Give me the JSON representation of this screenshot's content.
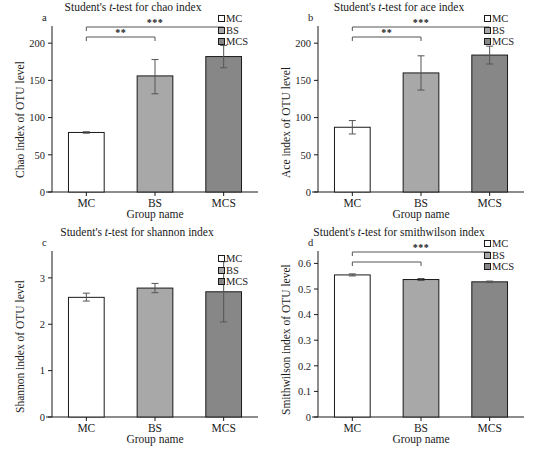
{
  "figure": {
    "panels": [
      {
        "letter": "a",
        "title_pre": "Student's ",
        "title_ital": "t",
        "title_post": "-test for chao index",
        "ylabel": "Chao index of OTU level",
        "xlabel": "Group name"
      },
      {
        "letter": "b",
        "title_pre": "Student's ",
        "title_ital": "t",
        "title_post": "-test for ace index",
        "ylabel": "Ace index of OTU level",
        "xlabel": "Group name"
      },
      {
        "letter": "c",
        "title_pre": "Student's ",
        "title_ital": "t",
        "title_post": "-test for shannon index",
        "ylabel": "Shannon index of OTU level",
        "xlabel": "Group name"
      },
      {
        "letter": "d",
        "title_pre": "Student's ",
        "title_ital": "t",
        "title_post": "-test for smithwilson index",
        "ylabel": "Smithwilson index of OTU level",
        "xlabel": "Group name"
      }
    ],
    "legend": [
      {
        "label": "MC",
        "color": "#ffffff"
      },
      {
        "label": "BS",
        "color": "#a8a8a8"
      },
      {
        "label": "MCS",
        "color": "#878787"
      }
    ]
  },
  "chart_data": [
    {
      "type": "bar",
      "panel": "a",
      "title": "Student's t-test for chao index",
      "xlabel": "Group name",
      "ylabel": "Chao index of OTU level",
      "categories": [
        "MC",
        "BS",
        "MCS"
      ],
      "values": [
        80,
        156,
        182
      ],
      "errors_low": [
        79,
        132,
        167
      ],
      "errors_high": [
        81,
        178,
        197
      ],
      "colors": [
        "#ffffff",
        "#a8a8a8",
        "#878787"
      ],
      "ylim": [
        0,
        215
      ],
      "yticks": [
        0,
        50,
        100,
        150,
        200
      ],
      "ytick_labels": [
        "0",
        "50",
        "100",
        "150",
        "200"
      ],
      "grid": false,
      "legend_position": "top-right",
      "annotations": [
        {
          "label": "***",
          "from": "MC",
          "to": "MCS"
        },
        {
          "label": "**",
          "from": "MC",
          "to": "BS"
        }
      ]
    },
    {
      "type": "bar",
      "panel": "b",
      "title": "Student's t-test for ace index",
      "xlabel": "Group name",
      "ylabel": "Ace index of OTU level",
      "categories": [
        "MC",
        "BS",
        "MCS"
      ],
      "values": [
        87,
        160,
        184
      ],
      "errors_low": [
        78,
        137,
        172
      ],
      "errors_high": [
        96,
        183,
        196
      ],
      "colors": [
        "#ffffff",
        "#a8a8a8",
        "#878787"
      ],
      "ylim": [
        0,
        215
      ],
      "yticks": [
        0,
        50,
        100,
        150,
        200
      ],
      "ytick_labels": [
        "0",
        "50",
        "100",
        "150",
        "200"
      ],
      "grid": false,
      "legend_position": "top-right",
      "annotations": [
        {
          "label": "***",
          "from": "MC",
          "to": "MCS"
        },
        {
          "label": "**",
          "from": "MC",
          "to": "BS"
        }
      ]
    },
    {
      "type": "bar",
      "panel": "c",
      "title": "Student's t-test for shannon index",
      "xlabel": "Group name",
      "ylabel": "Shannon index of OTU level",
      "categories": [
        "MC",
        "BS",
        "MCS"
      ],
      "values": [
        2.58,
        2.78,
        2.7
      ],
      "errors_low": [
        2.5,
        2.68,
        2.05
      ],
      "errors_high": [
        2.67,
        2.88,
        3.35
      ],
      "colors": [
        "#ffffff",
        "#a8a8a8",
        "#878787"
      ],
      "ylim": [
        0,
        3.45
      ],
      "yticks": [
        0,
        1,
        2,
        3
      ],
      "ytick_labels": [
        "0",
        "1",
        "2",
        "3"
      ],
      "grid": false,
      "legend_position": "top-right",
      "annotations": []
    },
    {
      "type": "bar",
      "panel": "d",
      "title": "Student's t-test for smithwilson index",
      "xlabel": "Group name",
      "ylabel": "Smithwilson index of OTU level",
      "categories": [
        "MC",
        "BS",
        "MCS"
      ],
      "values": [
        0.555,
        0.537,
        0.528
      ],
      "errors_low": [
        0.551,
        0.533,
        0.525
      ],
      "errors_high": [
        0.559,
        0.541,
        0.531
      ],
      "colors": [
        "#ffffff",
        "#a8a8a8",
        "#878787"
      ],
      "ylim": [
        0,
        0.625
      ],
      "yticks": [
        0,
        0.1,
        0.2,
        0.3,
        0.4,
        0.5,
        0.6
      ],
      "ytick_labels": [
        "0",
        "0.1",
        "0.2",
        "0.3",
        "0.4",
        "0.5",
        "0.6"
      ],
      "grid": false,
      "legend_position": "top-right",
      "annotations": [
        {
          "label": "***",
          "from": "MC",
          "to": "MCS"
        },
        {
          "label": "",
          "from": "MC",
          "to": "BS"
        }
      ]
    }
  ]
}
